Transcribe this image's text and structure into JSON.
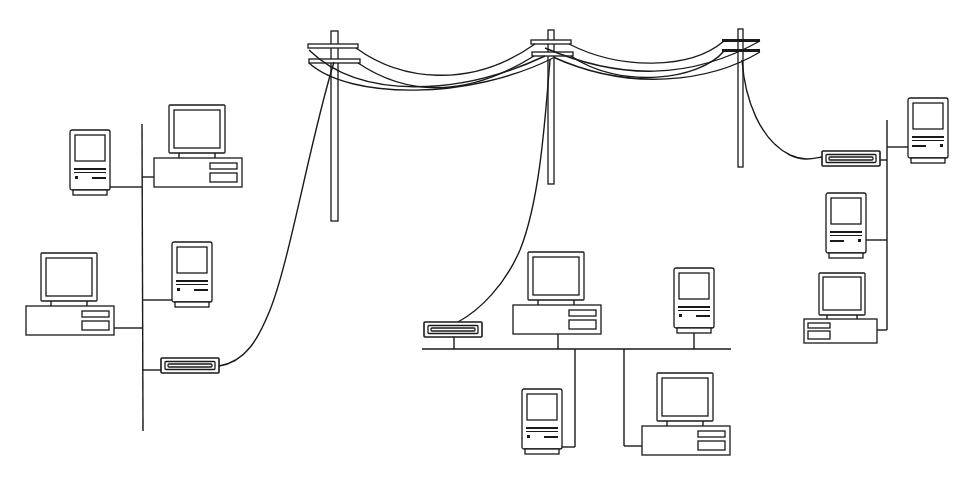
{
  "diagram": {
    "title": "",
    "colors": {
      "line": "#1a1a1a",
      "background": "#ffffff"
    },
    "telephone_line": {
      "poles": 3,
      "crossarms_per_pole": 2
    },
    "networks": [
      {
        "id": "left-lan",
        "bus": "vertical",
        "devices": [
          "compact-mac",
          "desktop-pc",
          "desktop-pc",
          "compact-mac",
          "modem"
        ]
      },
      {
        "id": "center-lan",
        "bus": "horizontal",
        "devices": [
          "modem",
          "desktop-pc",
          "compact-mac",
          "compact-mac",
          "desktop-pc"
        ]
      },
      {
        "id": "right-lan",
        "bus": "vertical",
        "devices": [
          "compact-mac",
          "modem",
          "compact-mac",
          "desktop-pc"
        ]
      }
    ],
    "icons": {
      "compact_mac": "compact-mac-icon",
      "desktop_pc": "desktop-pc-icon",
      "modem": "modem-icon",
      "pole": "telephone-pole-icon"
    }
  }
}
